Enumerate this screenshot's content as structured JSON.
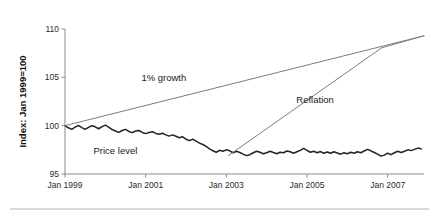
{
  "chart_data": {
    "type": "line",
    "title": "",
    "xlabel": "",
    "ylabel": "Index: Jan 1999=100",
    "ylim": [
      95,
      110
    ],
    "xlim": [
      1999.0,
      2007.9
    ],
    "grid": false,
    "legend": "none",
    "y_ticks": [
      "95",
      "100",
      "105",
      "110"
    ],
    "y_tick_values": [
      95,
      100,
      105,
      110
    ],
    "x_ticks": [
      "Jan 1999",
      "Jan 2001",
      "Jan 2003",
      "Jan 2005",
      "Jan 2007"
    ],
    "x_tick_values": [
      1999.0,
      2001.0,
      2003.0,
      2005.0,
      2007.0
    ],
    "annotations": [
      {
        "name": "one-percent-growth",
        "text": "1% growth",
        "x": 2001.45,
        "y": 104.6
      },
      {
        "name": "reflation",
        "text": "Reflation",
        "x": 2005.2,
        "y": 102.3
      },
      {
        "name": "price-level",
        "text": "Price level",
        "x": 2000.25,
        "y": 97.05
      }
    ],
    "series": [
      {
        "name": "Price level",
        "color": "#232323",
        "width": 1.5,
        "x": [
          1999.0,
          1999.083,
          1999.167,
          1999.25,
          1999.333,
          1999.417,
          1999.5,
          1999.583,
          1999.667,
          1999.75,
          1999.833,
          1999.917,
          2000.0,
          2000.083,
          2000.167,
          2000.25,
          2000.333,
          2000.417,
          2000.5,
          2000.583,
          2000.667,
          2000.75,
          2000.833,
          2000.917,
          2001.0,
          2001.083,
          2001.167,
          2001.25,
          2001.333,
          2001.417,
          2001.5,
          2001.583,
          2001.667,
          2001.75,
          2001.833,
          2001.917,
          2002.0,
          2002.083,
          2002.167,
          2002.25,
          2002.333,
          2002.417,
          2002.5,
          2002.583,
          2002.667,
          2002.75,
          2002.833,
          2002.917,
          2003.0,
          2003.083,
          2003.167,
          2003.25,
          2003.333,
          2003.417,
          2003.5,
          2003.583,
          2003.667,
          2003.75,
          2003.833,
          2003.917,
          2004.0,
          2004.083,
          2004.167,
          2004.25,
          2004.333,
          2004.417,
          2004.5,
          2004.583,
          2004.667,
          2004.75,
          2004.833,
          2004.917,
          2005.0,
          2005.083,
          2005.167,
          2005.25,
          2005.333,
          2005.417,
          2005.5,
          2005.583,
          2005.667,
          2005.75,
          2005.833,
          2005.917,
          2006.0,
          2006.083,
          2006.167,
          2006.25,
          2006.333,
          2006.417,
          2006.5,
          2006.583,
          2006.667,
          2006.75,
          2006.833,
          2006.917,
          2007.0,
          2007.083,
          2007.167,
          2007.25,
          2007.333,
          2007.417,
          2007.5,
          2007.583,
          2007.667,
          2007.75,
          2007.833
        ],
        "y": [
          100.0,
          99.78,
          99.62,
          99.85,
          100.02,
          99.8,
          99.62,
          99.82,
          100.0,
          99.88,
          99.68,
          99.9,
          100.05,
          99.85,
          99.6,
          99.45,
          99.3,
          99.5,
          99.62,
          99.4,
          99.28,
          99.45,
          99.5,
          99.3,
          99.18,
          99.3,
          99.38,
          99.2,
          99.12,
          99.22,
          99.05,
          98.92,
          99.05,
          98.9,
          98.75,
          98.85,
          98.6,
          98.45,
          98.6,
          98.4,
          98.2,
          98.05,
          97.85,
          97.6,
          97.4,
          97.25,
          97.45,
          97.35,
          97.5,
          97.4,
          97.2,
          97.35,
          97.22,
          97.05,
          96.9,
          97.0,
          97.2,
          97.35,
          97.25,
          97.1,
          97.2,
          97.35,
          97.22,
          97.1,
          97.25,
          97.2,
          97.38,
          97.3,
          97.15,
          97.3,
          97.45,
          97.65,
          97.45,
          97.25,
          97.35,
          97.2,
          97.32,
          97.15,
          97.28,
          97.15,
          97.3,
          97.18,
          97.05,
          97.2,
          97.1,
          97.25,
          97.15,
          97.3,
          97.2,
          97.38,
          97.55,
          97.4,
          97.22,
          97.05,
          96.85,
          96.95,
          97.15,
          97.0,
          97.2,
          97.35,
          97.22,
          97.35,
          97.5,
          97.42,
          97.55,
          97.68,
          97.6
        ]
      },
      {
        "name": "1% growth",
        "color": "#7d7d7d",
        "width": 1.0,
        "x": [
          1999.0,
          2007.9
        ],
        "y": [
          100.0,
          109.3
        ]
      },
      {
        "name": "Reflation",
        "color": "#7d7d7d",
        "width": 1.0,
        "x": [
          2003.05,
          2006.85,
          2007.9
        ],
        "y": [
          96.9,
          108.05,
          109.3
        ]
      }
    ]
  }
}
